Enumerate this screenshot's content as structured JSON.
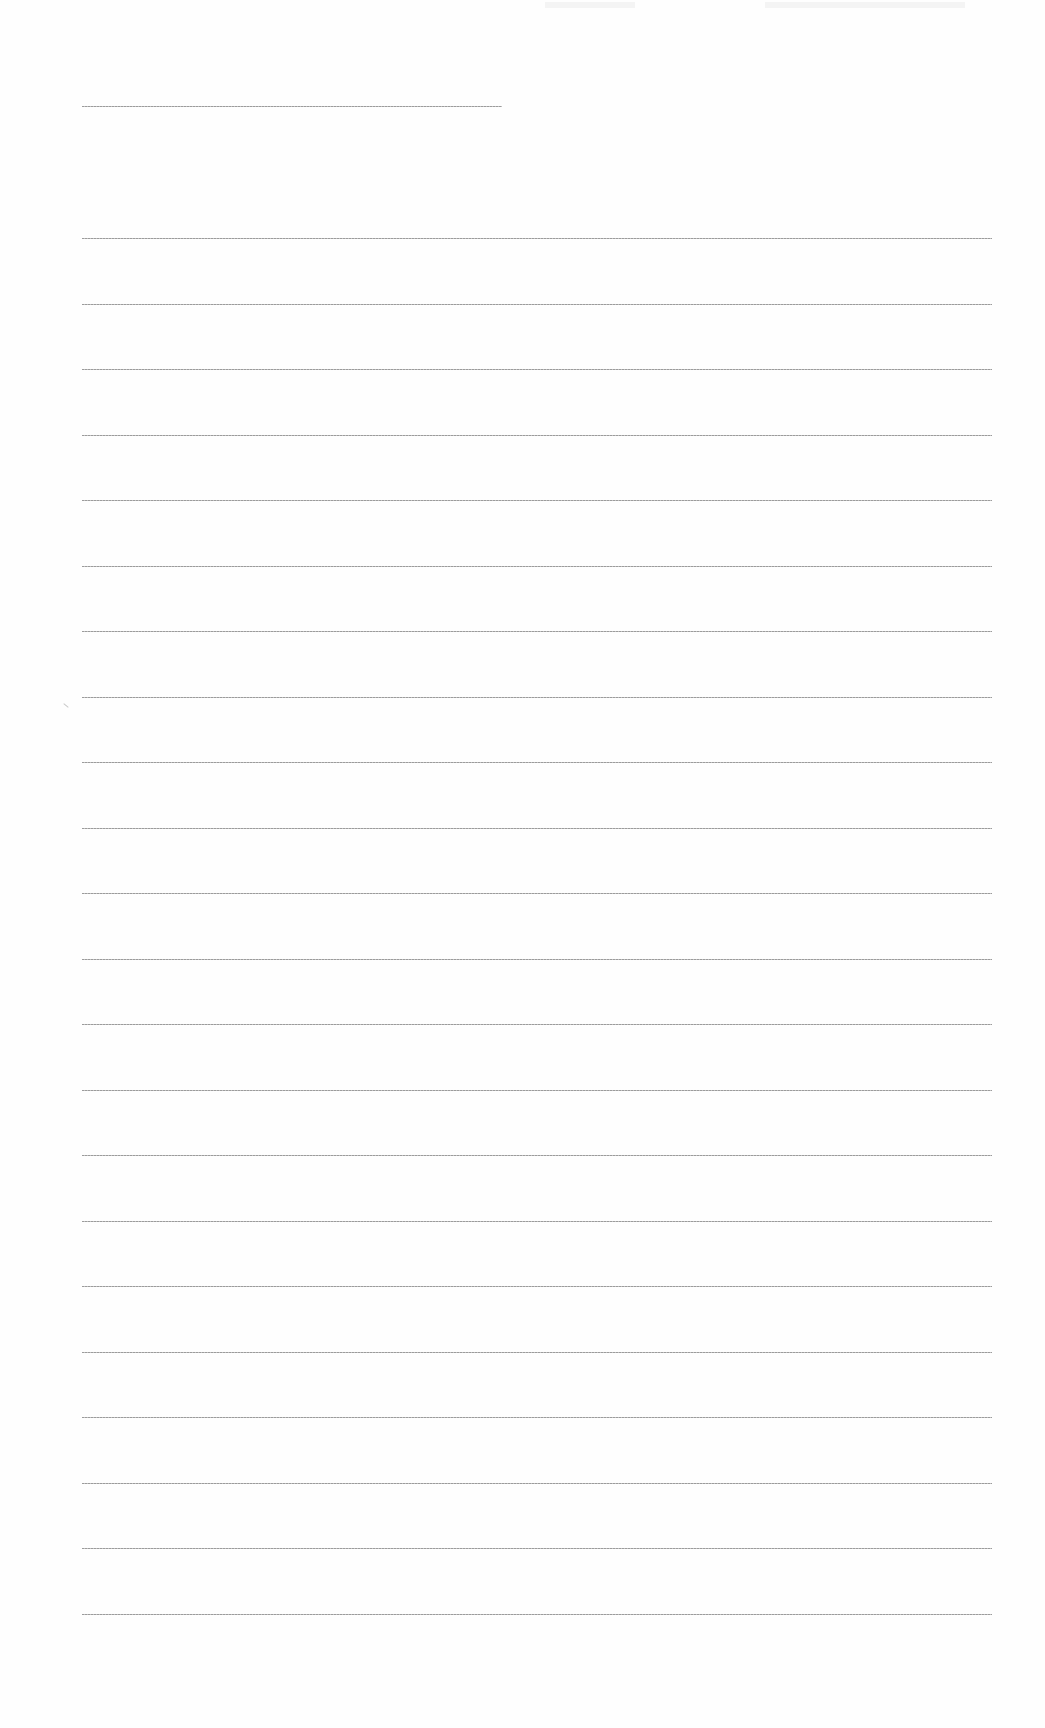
{
  "document": {
    "type": "blank-lined-sheet",
    "title_line": {
      "label": "",
      "top_px": 106,
      "left_px": 82,
      "width_px": 420
    },
    "writing_lines": {
      "count": 22,
      "first_top_px": 238,
      "spacing_px": 65.5,
      "left_px": 82,
      "width_px": 910,
      "values": [
        "",
        "",
        "",
        "",
        "",
        "",
        "",
        "",
        "",
        "",
        "",
        "",
        "",
        "",
        "",
        "",
        "",
        "",
        "",
        "",
        "",
        ""
      ]
    },
    "colors": {
      "paper": "#fefefe",
      "rule": "#8a8a8a"
    }
  }
}
